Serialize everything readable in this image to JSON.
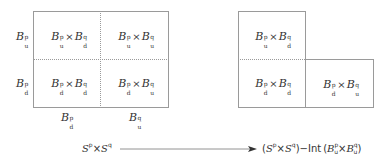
{
  "left_diagram": {
    "row_labels": [
      {
        "base": "B",
        "sup": "p",
        "sub": "u"
      },
      {
        "base": "B",
        "sup": "p",
        "sub": "d"
      }
    ],
    "column_labels": [
      {
        "base": "B",
        "sup": "p",
        "sub": "d"
      },
      {
        "base": "B",
        "sup": "q",
        "sub": "u"
      }
    ],
    "cells": [
      {
        "a": {
          "base": "B",
          "sup": "p",
          "sub": "u"
        },
        "b": {
          "base": "B",
          "sup": "q",
          "sub": "d"
        }
      },
      {
        "a": {
          "base": "B",
          "sup": "p",
          "sub": "u"
        },
        "b": {
          "base": "B",
          "sup": "q",
          "sub": "u"
        }
      },
      {
        "a": {
          "base": "B",
          "sup": "p",
          "sub": "d"
        },
        "b": {
          "base": "B",
          "sup": "q",
          "sub": "d"
        }
      },
      {
        "a": {
          "base": "B",
          "sup": "p",
          "sub": "d"
        },
        "b": {
          "base": "B",
          "sup": "q",
          "sub": "u"
        }
      }
    ]
  },
  "right_diagram": {
    "cells": [
      {
        "a": {
          "base": "B",
          "sup": "p",
          "sub": "u"
        },
        "b": {
          "base": "B",
          "sup": "q",
          "sub": "d"
        }
      },
      {
        "a": {
          "base": "B",
          "sup": "p",
          "sub": "d"
        },
        "b": {
          "base": "B",
          "sup": "q",
          "sub": "d"
        }
      },
      {
        "a": {
          "base": "B",
          "sup": "p",
          "sub": "d"
        },
        "b": {
          "base": "B",
          "sup": "q",
          "sub": "u"
        }
      }
    ]
  },
  "times": "×",
  "map": {
    "source": {
      "s1": "S",
      "p": "p",
      "times": "×",
      "s2": "S",
      "q": "q"
    },
    "target": {
      "open": "(",
      "s1": "S",
      "p": "p",
      "times": "×",
      "s2": "S",
      "q": "q",
      "close": ")",
      "minus": "−",
      "int": "Int",
      "lparen": "(",
      "b1": "B",
      "b1sup": "p",
      "b1sub": "u",
      "times2": "×",
      "b2": "B",
      "b2sup": "q",
      "b2sub": "u",
      "rparen": ")"
    }
  },
  "colors": {
    "line": "#9a9a9a",
    "text": "#333333"
  }
}
